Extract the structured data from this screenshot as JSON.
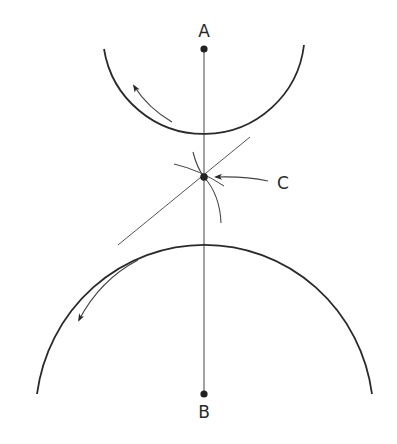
{
  "diagram": {
    "type": "gear-pitch-circles",
    "labels": {
      "A": "A",
      "B": "B",
      "C": "C"
    },
    "points": {
      "A": {
        "x": 204,
        "y": 49
      },
      "B": {
        "x": 204,
        "y": 394
      },
      "C": {
        "x": 204,
        "y": 177
      }
    },
    "upper_circle": {
      "center": "A",
      "radius": 101,
      "rotation": "counterclockwise"
    },
    "lower_circle": {
      "center": "B",
      "radius": 172,
      "rotation": "counterclockwise"
    },
    "colors": {
      "stroke": "#2a2a2a",
      "background": "#ffffff"
    }
  }
}
